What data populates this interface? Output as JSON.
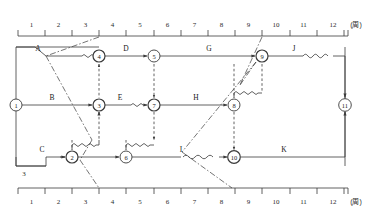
{
  "figure": {
    "type": "time-scaled-network-diagram",
    "unit_label": "(周)",
    "stray_label_below_c": "3"
  },
  "top_axis": {
    "name": "top-time-axis",
    "ticks": [
      "1",
      "2",
      "3",
      "4",
      "5",
      "6",
      "7",
      "8",
      "9",
      "10",
      "11",
      "12"
    ],
    "unit": "(周)"
  },
  "bottom_axis": {
    "name": "bottom-time-axis",
    "ticks": [
      "1",
      "2",
      "3",
      "4",
      "5",
      "6",
      "7",
      "8",
      "9",
      "10",
      "11",
      "12"
    ],
    "unit": "(周)"
  },
  "nodes": [
    {
      "id": "1",
      "label": "1",
      "x": 16,
      "y": 105
    },
    {
      "id": "2",
      "label": "2",
      "x": 72,
      "y": 157
    },
    {
      "id": "3",
      "label": "3",
      "x": 99,
      "y": 105
    },
    {
      "id": "4",
      "label": "4",
      "x": 99,
      "y": 56
    },
    {
      "id": "5",
      "label": "5",
      "x": 154,
      "y": 56
    },
    {
      "id": "6",
      "label": "6",
      "x": 126,
      "y": 157
    },
    {
      "id": "7",
      "label": "7",
      "x": 154,
      "y": 105
    },
    {
      "id": "8",
      "label": "8",
      "x": 234,
      "y": 105
    },
    {
      "id": "9",
      "label": "9",
      "x": 262,
      "y": 56
    },
    {
      "id": "10",
      "label": "10",
      "x": 234,
      "y": 157
    },
    {
      "id": "11",
      "label": "11",
      "x": 345,
      "y": 105
    }
  ],
  "activities": [
    {
      "id": "A",
      "label": "A",
      "lx": 38,
      "ly": 51
    },
    {
      "id": "B",
      "label": "B",
      "lx": 52,
      "ly": 100
    },
    {
      "id": "C",
      "label": "C",
      "lx": 42,
      "ly": 152
    },
    {
      "id": "D",
      "label": "D",
      "lx": 126,
      "ly": 51
    },
    {
      "id": "E",
      "label": "E",
      "lx": 120,
      "ly": 100
    },
    {
      "id": "G",
      "label": "G",
      "lx": 209,
      "ly": 51
    },
    {
      "id": "H",
      "label": "H",
      "lx": 196,
      "ly": 100
    },
    {
      "id": "I",
      "label": "I",
      "lx": 181,
      "ly": 152
    },
    {
      "id": "J",
      "label": "J",
      "lx": 294,
      "ly": 51
    },
    {
      "id": "K",
      "label": "K",
      "lx": 284,
      "ly": 152
    }
  ],
  "colors": {
    "line": "#3a3a3a",
    "text": "#1a1a1a",
    "background": "#ffffff"
  }
}
